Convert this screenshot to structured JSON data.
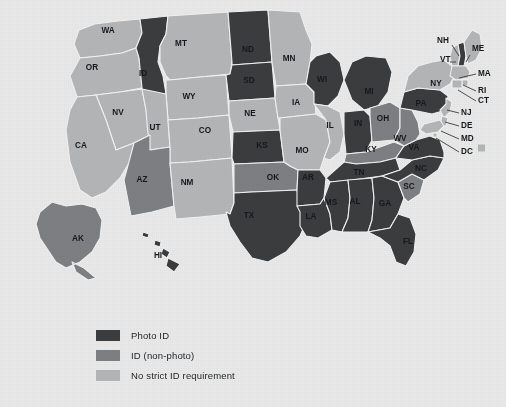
{
  "colors": {
    "background": "#e9e9e9",
    "photo_id": "#3a3c3e",
    "id_non_photo": "#7d8082",
    "no_strict_id": "#b3b5b6",
    "border": "#f2f2f2",
    "label_text": "#15191c"
  },
  "legend": {
    "items": [
      {
        "label": "Photo ID",
        "color": "#3a3c3e",
        "category": "photo_id"
      },
      {
        "label": "ID (non-photo)",
        "color": "#7d8082",
        "category": "id_non_photo"
      },
      {
        "label": "No strict ID requirement",
        "color": "#b3b5b6",
        "category": "no_strict_id"
      }
    ]
  },
  "chart_data": {
    "type": "map",
    "title": "",
    "region": "United States",
    "value_field": "voter_id_requirement",
    "categories": [
      "Photo ID",
      "ID (non-photo)",
      "No strict ID requirement"
    ],
    "states": [
      {
        "code": "WA",
        "category": "no_strict_id"
      },
      {
        "code": "OR",
        "category": "no_strict_id"
      },
      {
        "code": "CA",
        "category": "no_strict_id"
      },
      {
        "code": "NV",
        "category": "no_strict_id"
      },
      {
        "code": "ID",
        "category": "photo_id"
      },
      {
        "code": "MT",
        "category": "no_strict_id"
      },
      {
        "code": "WY",
        "category": "no_strict_id"
      },
      {
        "code": "UT",
        "category": "no_strict_id"
      },
      {
        "code": "AZ",
        "category": "id_non_photo"
      },
      {
        "code": "CO",
        "category": "no_strict_id"
      },
      {
        "code": "NM",
        "category": "no_strict_id"
      },
      {
        "code": "ND",
        "category": "photo_id"
      },
      {
        "code": "SD",
        "category": "photo_id"
      },
      {
        "code": "NE",
        "category": "no_strict_id"
      },
      {
        "code": "KS",
        "category": "photo_id"
      },
      {
        "code": "OK",
        "category": "id_non_photo"
      },
      {
        "code": "TX",
        "category": "photo_id"
      },
      {
        "code": "MN",
        "category": "no_strict_id"
      },
      {
        "code": "IA",
        "category": "no_strict_id"
      },
      {
        "code": "MO",
        "category": "no_strict_id"
      },
      {
        "code": "AR",
        "category": "photo_id"
      },
      {
        "code": "LA",
        "category": "photo_id"
      },
      {
        "code": "WI",
        "category": "photo_id"
      },
      {
        "code": "IL",
        "category": "no_strict_id"
      },
      {
        "code": "MI",
        "category": "photo_id"
      },
      {
        "code": "IN",
        "category": "photo_id"
      },
      {
        "code": "OH",
        "category": "id_non_photo"
      },
      {
        "code": "KY",
        "category": "id_non_photo"
      },
      {
        "code": "TN",
        "category": "photo_id"
      },
      {
        "code": "MS",
        "category": "photo_id"
      },
      {
        "code": "AL",
        "category": "photo_id"
      },
      {
        "code": "GA",
        "category": "photo_id"
      },
      {
        "code": "FL",
        "category": "photo_id"
      },
      {
        "code": "SC",
        "category": "id_non_photo"
      },
      {
        "code": "NC",
        "category": "photo_id"
      },
      {
        "code": "VA",
        "category": "photo_id"
      },
      {
        "code": "WV",
        "category": "id_non_photo"
      },
      {
        "code": "PA",
        "category": "photo_id"
      },
      {
        "code": "NY",
        "category": "no_strict_id"
      },
      {
        "code": "VT",
        "category": "no_strict_id"
      },
      {
        "code": "NH",
        "category": "photo_id"
      },
      {
        "code": "ME",
        "category": "no_strict_id"
      },
      {
        "code": "MA",
        "category": "no_strict_id"
      },
      {
        "code": "RI",
        "category": "no_strict_id"
      },
      {
        "code": "CT",
        "category": "no_strict_id"
      },
      {
        "code": "NJ",
        "category": "no_strict_id"
      },
      {
        "code": "DE",
        "category": "no_strict_id"
      },
      {
        "code": "MD",
        "category": "no_strict_id"
      },
      {
        "code": "DC",
        "category": "no_strict_id"
      },
      {
        "code": "AK",
        "category": "id_non_photo"
      },
      {
        "code": "HI",
        "category": "photo_id"
      }
    ]
  },
  "labels": {
    "inline": [
      {
        "code": "WA",
        "x": 108,
        "y": 31
      },
      {
        "code": "OR",
        "x": 92,
        "y": 68
      },
      {
        "code": "ID",
        "x": 143,
        "y": 74
      },
      {
        "code": "MT",
        "x": 181,
        "y": 44
      },
      {
        "code": "ND",
        "x": 248,
        "y": 50
      },
      {
        "code": "SD",
        "x": 249,
        "y": 81
      },
      {
        "code": "MN",
        "x": 289,
        "y": 59
      },
      {
        "code": "WI",
        "x": 322,
        "y": 80
      },
      {
        "code": "NY",
        "x": 436,
        "y": 84
      },
      {
        "code": "WY",
        "x": 189,
        "y": 97
      },
      {
        "code": "NV",
        "x": 118,
        "y": 113
      },
      {
        "code": "UT",
        "x": 155,
        "y": 128
      },
      {
        "code": "CO",
        "x": 205,
        "y": 131
      },
      {
        "code": "NE",
        "x": 250,
        "y": 114
      },
      {
        "code": "IA",
        "x": 296,
        "y": 103
      },
      {
        "code": "IL",
        "x": 330,
        "y": 126
      },
      {
        "code": "IN",
        "x": 358,
        "y": 124
      },
      {
        "code": "MI",
        "x": 369,
        "y": 92
      },
      {
        "code": "OH",
        "x": 383,
        "y": 119
      },
      {
        "code": "PA",
        "x": 421,
        "y": 104
      },
      {
        "code": "CA",
        "x": 81,
        "y": 146
      },
      {
        "code": "KS",
        "x": 262,
        "y": 146
      },
      {
        "code": "MO",
        "x": 302,
        "y": 151
      },
      {
        "code": "KY",
        "x": 371,
        "y": 150
      },
      {
        "code": "WV",
        "x": 400,
        "y": 139
      },
      {
        "code": "VA",
        "x": 414,
        "y": 148
      },
      {
        "code": "AZ",
        "x": 142,
        "y": 180
      },
      {
        "code": "NM",
        "x": 187,
        "y": 183
      },
      {
        "code": "OK",
        "x": 273,
        "y": 178
      },
      {
        "code": "AR",
        "x": 308,
        "y": 178
      },
      {
        "code": "TN",
        "x": 359,
        "y": 173
      },
      {
        "code": "NC",
        "x": 421,
        "y": 169
      },
      {
        "code": "SC",
        "x": 409,
        "y": 187
      },
      {
        "code": "MS",
        "x": 331,
        "y": 203
      },
      {
        "code": "AL",
        "x": 355,
        "y": 202
      },
      {
        "code": "GA",
        "x": 385,
        "y": 204
      },
      {
        "code": "TX",
        "x": 249,
        "y": 216
      },
      {
        "code": "LA",
        "x": 311,
        "y": 217
      },
      {
        "code": "FL",
        "x": 408,
        "y": 242
      },
      {
        "code": "AK",
        "x": 78,
        "y": 239
      },
      {
        "code": "HI",
        "x": 158,
        "y": 256
      }
    ],
    "callouts": [
      {
        "code": "NH",
        "tx": 437,
        "ty": 41,
        "lx1": 452,
        "ly1": 45,
        "lx2": 459,
        "ly2": 56
      },
      {
        "code": "ME",
        "tx": 472,
        "ty": 49,
        "lx1": 470,
        "ly1": 55,
        "lx2": 466,
        "ly2": 62
      },
      {
        "code": "VT",
        "tx": 440,
        "ty": 60,
        "lx1": 450,
        "ly1": 62,
        "lx2": 456,
        "ly2": 62
      },
      {
        "code": "MA",
        "tx": 478,
        "ty": 74,
        "lx1": 476,
        "ly1": 74,
        "lx2": 459,
        "ly2": 78
      },
      {
        "code": "RI",
        "tx": 478,
        "ty": 91,
        "lx1": 476,
        "ly1": 91,
        "lx2": 463,
        "ly2": 85
      },
      {
        "code": "CT",
        "tx": 478,
        "ty": 101,
        "lx1": 476,
        "ly1": 101,
        "lx2": 458,
        "ly2": 90
      },
      {
        "code": "NJ",
        "tx": 461,
        "ty": 113,
        "lx1": 459,
        "ly1": 113,
        "lx2": 447,
        "ly2": 110
      },
      {
        "code": "DE",
        "tx": 461,
        "ty": 126,
        "lx1": 459,
        "ly1": 126,
        "lx2": 445,
        "ly2": 122
      },
      {
        "code": "MD",
        "tx": 461,
        "ty": 139,
        "lx1": 459,
        "ly1": 139,
        "lx2": 441,
        "ly2": 131
      },
      {
        "code": "DC",
        "tx": 461,
        "ty": 152,
        "lx1": 459,
        "ly1": 152,
        "lx2": 436,
        "ly2": 138
      }
    ]
  },
  "dc_marker": {
    "x": 478,
    "y": 148,
    "size": 7
  }
}
